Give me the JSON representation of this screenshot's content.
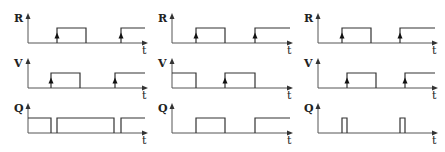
{
  "diagram": {
    "type": "timing-diagram",
    "columns": 3,
    "time_label": "t",
    "panels": [
      {
        "axis_x": 28,
        "end_x": 145,
        "signals": [
          {
            "name": "R",
            "label_y": 22,
            "base_y": 43,
            "high_y": 28,
            "segments": [
              [
                57,
                86
              ],
              [
                121,
                145
              ]
            ],
            "edge_arrows": [
              57,
              121
            ]
          },
          {
            "name": "V",
            "label_y": 67,
            "base_y": 88,
            "high_y": 73,
            "segments": [
              [
                51,
                80
              ],
              [
                115,
                145
              ]
            ],
            "edge_arrows": [
              51,
              115
            ]
          },
          {
            "name": "Q",
            "label_y": 112,
            "base_y": 133,
            "high_y": 118,
            "segments": [
              [
                28,
                51
              ],
              [
                57,
                114
              ],
              [
                121,
                145
              ]
            ],
            "edge_arrows": []
          }
        ]
      },
      {
        "axis_x": 172,
        "end_x": 290,
        "signals": [
          {
            "name": "R",
            "label_y": 22,
            "base_y": 43,
            "high_y": 28,
            "segments": [
              [
                196,
                225
              ],
              [
                255,
                290
              ]
            ],
            "edge_arrows": [
              196,
              255
            ]
          },
          {
            "name": "V",
            "label_y": 67,
            "base_y": 88,
            "high_y": 73,
            "segments": [
              [
                172,
                196
              ],
              [
                225,
                255
              ]
            ],
            "edge_arrows": [
              225
            ]
          },
          {
            "name": "Q",
            "label_y": 112,
            "base_y": 133,
            "high_y": 118,
            "segments": [
              [
                196,
                225
              ],
              [
                255,
                290
              ]
            ],
            "edge_arrows": []
          }
        ]
      },
      {
        "axis_x": 318,
        "end_x": 435,
        "signals": [
          {
            "name": "R",
            "label_y": 22,
            "base_y": 43,
            "high_y": 28,
            "segments": [
              [
                342,
                371
              ],
              [
                400,
                435
              ]
            ],
            "edge_arrows": [
              342,
              400
            ]
          },
          {
            "name": "V",
            "label_y": 67,
            "base_y": 88,
            "high_y": 73,
            "segments": [
              [
                347,
                376
              ],
              [
                405,
                435
              ]
            ],
            "edge_arrows": [
              347,
              405
            ]
          },
          {
            "name": "Q",
            "label_y": 112,
            "base_y": 133,
            "high_y": 118,
            "segments": [
              [
                342,
                347
              ],
              [
                400,
                405
              ]
            ],
            "edge_arrows": []
          }
        ]
      }
    ]
  }
}
